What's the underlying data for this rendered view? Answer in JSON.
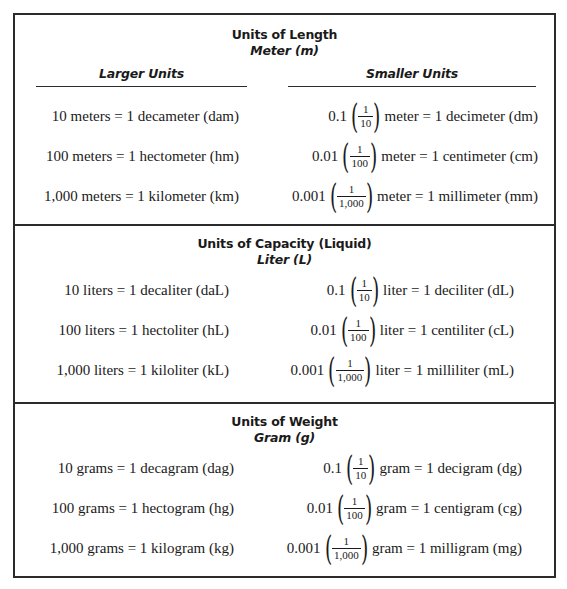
{
  "table": {
    "column_headers": {
      "larger": "Larger Units",
      "smaller": "Smaller Units"
    },
    "sections": [
      {
        "title": "Units of Length",
        "base_unit": "Meter (m)",
        "rows": [
          {
            "larger": "10 meters = 1 decameter (dam)",
            "decimal": "0.1",
            "frac_num": "1",
            "frac_den": "10",
            "smaller_rest": "meter = 1 decimeter (dm)"
          },
          {
            "larger": "100 meters = 1 hectometer (hm)",
            "decimal": "0.01",
            "frac_num": "1",
            "frac_den": "100",
            "smaller_rest": "meter = 1 centimeter (cm)"
          },
          {
            "larger": "1,000 meters = 1 kilometer (km)",
            "decimal": "0.001",
            "frac_num": "1",
            "frac_den": "1,000",
            "smaller_rest": "meter = 1 millimeter (mm)"
          }
        ]
      },
      {
        "title": "Units of Capacity (Liquid)",
        "base_unit": "Liter (L)",
        "rows": [
          {
            "larger": "10 liters = 1 decaliter (daL)",
            "decimal": "0.1",
            "frac_num": "1",
            "frac_den": "10",
            "smaller_rest": "liter = 1 deciliter (dL)"
          },
          {
            "larger": "100 liters = 1 hectoliter (hL)",
            "decimal": "0.01",
            "frac_num": "1",
            "frac_den": "100",
            "smaller_rest": "liter = 1 centiliter (cL)"
          },
          {
            "larger": "1,000 liters = 1 kiloliter (kL)",
            "decimal": "0.001",
            "frac_num": "1",
            "frac_den": "1,000",
            "smaller_rest": "liter = 1 milliliter (mL)"
          }
        ]
      },
      {
        "title": "Units of Weight",
        "base_unit": "Gram (g)",
        "rows": [
          {
            "larger": "10 grams = 1 decagram (dag)",
            "decimal": "0.1",
            "frac_num": "1",
            "frac_den": "10",
            "smaller_rest": "gram = 1 decigram (dg)"
          },
          {
            "larger": "100 grams = 1 hectogram (hg)",
            "decimal": "0.01",
            "frac_num": "1",
            "frac_den": "100",
            "smaller_rest": "gram = 1 centigram (cg)"
          },
          {
            "larger": "1,000 grams = 1 kilogram (kg)",
            "decimal": "0.001",
            "frac_num": "1",
            "frac_den": "1,000",
            "smaller_rest": "gram = 1 milligram (mg)"
          }
        ]
      }
    ]
  }
}
